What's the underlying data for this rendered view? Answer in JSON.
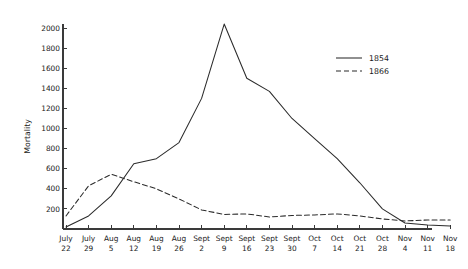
{
  "chart_data": {
    "type": "line",
    "title": "",
    "subtitle": "",
    "xlabel": "",
    "ylabel": "Mortality",
    "grid": false,
    "legend_position": "right",
    "ylim": [
      0,
      2100
    ],
    "yticks": [
      200,
      400,
      600,
      800,
      1000,
      1200,
      1400,
      1600,
      1800,
      2000
    ],
    "ytick_labels": [
      "200",
      "400",
      "600",
      "800",
      "1000",
      "1200",
      "1400",
      "1600",
      "1800",
      "2000"
    ],
    "categories": [
      "July 22",
      "July 29",
      "Aug 5",
      "Aug 12",
      "Aug 19",
      "Aug 26",
      "Sept 2",
      "Sept 9",
      "Sept 16",
      "Sept 23",
      "Sept 30",
      "Oct 7",
      "Oct 14",
      "Oct 21",
      "Oct 28",
      "Nov 4",
      "Nov 11",
      "Nov 18"
    ],
    "xtick_labels_top": [
      "July",
      "July",
      "Aug",
      "Aug",
      "Aug",
      "Aug",
      "Sept",
      "Sept",
      "Sept",
      "Sept",
      "Sept",
      "Oct",
      "Oct",
      "Oct",
      "Oct",
      "Nov",
      "Nov",
      "Nov"
    ],
    "xtick_labels_bottom": [
      "22",
      "29",
      "5",
      "12",
      "19",
      "26",
      "2",
      "9",
      "16",
      "23",
      "30",
      "7",
      "14",
      "21",
      "28",
      "4",
      "11",
      "18"
    ],
    "series": [
      {
        "name": "1854",
        "style": "solid",
        "color": "#2b2b2b",
        "values": [
          20,
          130,
          330,
          650,
          700,
          860,
          1300,
          2040,
          1500,
          1370,
          1100,
          900,
          700,
          460,
          200,
          60,
          40,
          30
        ]
      },
      {
        "name": "1866",
        "style": "dashed",
        "color": "#2b2b2b",
        "values": [
          130,
          430,
          545,
          470,
          400,
          300,
          190,
          145,
          150,
          120,
          135,
          140,
          150,
          130,
          100,
          80,
          90,
          90
        ]
      }
    ]
  },
  "legend": {
    "entries": [
      {
        "label": "1854",
        "style": "solid"
      },
      {
        "label": "1866",
        "style": "dashed"
      }
    ]
  }
}
